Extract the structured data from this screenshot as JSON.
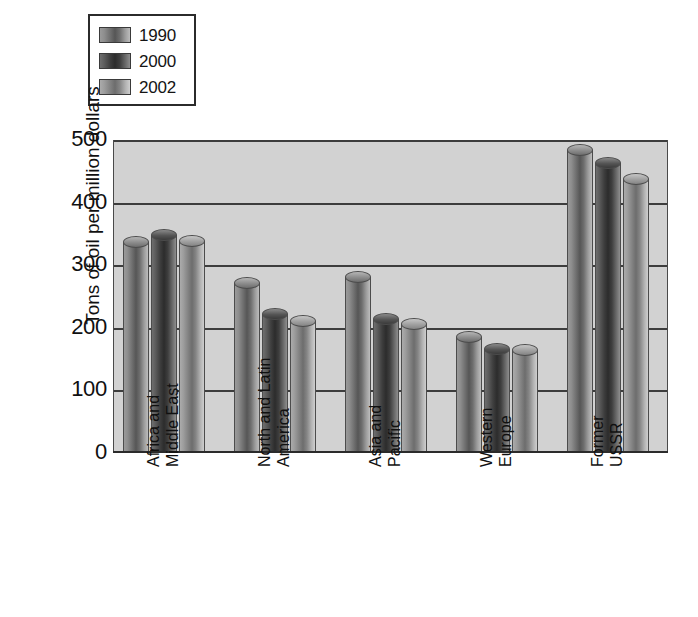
{
  "chart_data": {
    "type": "bar",
    "title": "",
    "xlabel": "",
    "ylabel": "Tons of oil per million dollars",
    "ylim": [
      0,
      500
    ],
    "yticks": [
      0,
      100,
      200,
      300,
      400,
      500
    ],
    "grid": true,
    "legend_position": "top-left",
    "categories": [
      "Africa and Middle East",
      "North and Latin America",
      "Asia and Pacific",
      "Western Europe",
      "Former USSR"
    ],
    "category_lines": [
      [
        "Africa and",
        "Middle East"
      ],
      [
        "North and Latin",
        "America"
      ],
      [
        "Asia and",
        "Pacific"
      ],
      [
        "Western",
        "Europe"
      ],
      [
        "Former",
        "USSR"
      ]
    ],
    "series": [
      {
        "name": "1990",
        "color": "#8c8c8c",
        "values": [
          335,
          270,
          280,
          184,
          483
        ]
      },
      {
        "name": "2000",
        "color": "#3d3d3d",
        "values": [
          346,
          220,
          212,
          165,
          462
        ]
      },
      {
        "name": "2002",
        "color": "#a3a3a3",
        "values": [
          337,
          210,
          204,
          163,
          436
        ]
      }
    ]
  },
  "legend": {
    "items": [
      {
        "label": "1990"
      },
      {
        "label": "2000"
      },
      {
        "label": "2002"
      }
    ]
  },
  "axis": {
    "y_title": "Tons of oil per million dollars",
    "y_ticks": [
      "500",
      "400",
      "300",
      "200",
      "100",
      "0"
    ]
  }
}
